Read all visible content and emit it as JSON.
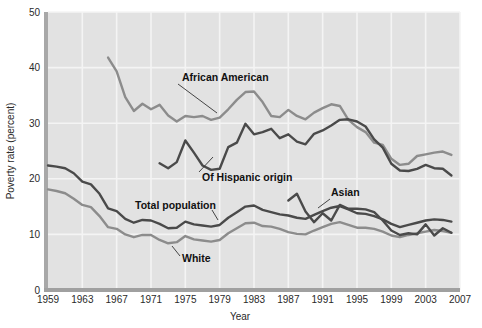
{
  "figure": {
    "background": "#ffffff",
    "plot_background": "#e2e2e2",
    "gridline_color": "#f4f4f4",
    "axis_color": "#9a9a9a"
  },
  "axes": {
    "y_title": "Poverty rate (percent)",
    "x_title": "Year",
    "y_ticks": [
      "0",
      "10",
      "20",
      "30",
      "40",
      "50"
    ],
    "x_ticks": [
      "1959",
      "1963",
      "1967",
      "1971",
      "1975",
      "1979",
      "1983",
      "1987",
      "1991",
      "1995",
      "1999",
      "2003",
      "2007"
    ]
  },
  "labels": {
    "african_american": "African American",
    "hispanic": "Of Hispanic origin",
    "total_population": "Total population",
    "white": "White",
    "asian": "Asian"
  },
  "chart_data": {
    "type": "line",
    "title": "",
    "xlabel": "Year",
    "ylabel": "Poverty rate (percent)",
    "xlim": [
      1959,
      2007
    ],
    "ylim": [
      0,
      50
    ],
    "grid": true,
    "legend": "inline-annotations",
    "x_tick_step": 4,
    "y_tick_step": 10,
    "colors": {
      "african_american": "#8c8c8c",
      "hispanic": "#4a4a4a",
      "total_population": "#4a4a4a",
      "white": "#8c8c8c",
      "asian": "#4a4a4a"
    },
    "series": [
      {
        "name": "African American",
        "color": "#8c8c8c",
        "x": [
          1966,
          1967,
          1968,
          1969,
          1970,
          1971,
          1972,
          1973,
          1974,
          1975,
          1976,
          1977,
          1978,
          1979,
          1980,
          1981,
          1982,
          1983,
          1984,
          1985,
          1986,
          1987,
          1988,
          1989,
          1990,
          1991,
          1992,
          1993,
          1994,
          1995,
          1996,
          1997,
          1998,
          1999,
          2000,
          2001,
          2002,
          2003,
          2004,
          2005,
          2006
        ],
        "values": [
          41.8,
          39.3,
          34.7,
          32.2,
          33.5,
          32.5,
          33.3,
          31.4,
          30.3,
          31.3,
          31.1,
          31.3,
          30.6,
          31.0,
          32.5,
          34.2,
          35.6,
          35.7,
          33.8,
          31.3,
          31.1,
          32.4,
          31.3,
          30.7,
          31.9,
          32.7,
          33.4,
          33.1,
          30.6,
          29.3,
          28.4,
          26.5,
          26.1,
          23.6,
          22.5,
          22.7,
          24.1,
          24.4,
          24.7,
          24.9,
          24.3
        ]
      },
      {
        "name": "Of Hispanic origin",
        "color": "#4a4a4a",
        "x": [
          1972,
          1973,
          1974,
          1975,
          1976,
          1977,
          1978,
          1979,
          1980,
          1981,
          1982,
          1983,
          1984,
          1985,
          1986,
          1987,
          1988,
          1989,
          1990,
          1991,
          1992,
          1993,
          1994,
          1995,
          1996,
          1997,
          1998,
          1999,
          2000,
          2001,
          2002,
          2003,
          2004,
          2005,
          2006
        ],
        "values": [
          22.8,
          21.9,
          23.0,
          26.9,
          24.7,
          22.4,
          21.6,
          21.8,
          25.7,
          26.5,
          29.9,
          28.0,
          28.4,
          29.0,
          27.3,
          28.0,
          26.7,
          26.2,
          28.1,
          28.7,
          29.6,
          30.6,
          30.7,
          30.3,
          29.4,
          27.1,
          25.6,
          22.7,
          21.5,
          21.4,
          21.8,
          22.5,
          21.9,
          21.8,
          20.6
        ]
      },
      {
        "name": "Total population",
        "color": "#4a4a4a",
        "x": [
          1959,
          1960,
          1961,
          1962,
          1963,
          1964,
          1965,
          1966,
          1967,
          1968,
          1969,
          1970,
          1971,
          1972,
          1973,
          1974,
          1975,
          1976,
          1977,
          1978,
          1979,
          1980,
          1981,
          1982,
          1983,
          1984,
          1985,
          1986,
          1987,
          1988,
          1989,
          1990,
          1991,
          1992,
          1993,
          1994,
          1995,
          1996,
          1997,
          1998,
          1999,
          2000,
          2001,
          2002,
          2003,
          2004,
          2005,
          2006
        ],
        "values": [
          22.4,
          22.2,
          21.9,
          21.0,
          19.5,
          19.0,
          17.3,
          14.7,
          14.2,
          12.8,
          12.1,
          12.6,
          12.5,
          11.9,
          11.1,
          11.2,
          12.3,
          11.8,
          11.6,
          11.4,
          11.7,
          13.0,
          14.0,
          15.0,
          15.2,
          14.4,
          14.0,
          13.6,
          13.4,
          13.0,
          12.8,
          13.5,
          14.2,
          14.8,
          15.1,
          14.5,
          13.8,
          13.7,
          13.3,
          12.7,
          11.9,
          11.3,
          11.7,
          12.1,
          12.5,
          12.7,
          12.6,
          12.3
        ]
      },
      {
        "name": "White",
        "color": "#8c8c8c",
        "x": [
          1959,
          1960,
          1961,
          1962,
          1963,
          1964,
          1965,
          1966,
          1967,
          1968,
          1969,
          1970,
          1971,
          1972,
          1973,
          1974,
          1975,
          1976,
          1977,
          1978,
          1979,
          1980,
          1981,
          1982,
          1983,
          1984,
          1985,
          1986,
          1987,
          1988,
          1989,
          1990,
          1991,
          1992,
          1993,
          1994,
          1995,
          1996,
          1997,
          1998,
          1999,
          2000,
          2001,
          2002,
          2003,
          2004,
          2005,
          2006
        ],
        "values": [
          18.1,
          17.8,
          17.4,
          16.4,
          15.3,
          14.9,
          13.3,
          11.3,
          11.0,
          10.0,
          9.5,
          9.9,
          9.9,
          9.0,
          8.4,
          8.6,
          9.7,
          9.1,
          8.9,
          8.7,
          9.0,
          10.2,
          11.1,
          12.0,
          12.1,
          11.5,
          11.4,
          11.0,
          10.4,
          10.1,
          10.0,
          10.7,
          11.3,
          11.9,
          12.2,
          11.7,
          11.2,
          11.2,
          11.0,
          10.5,
          9.8,
          9.5,
          9.9,
          10.2,
          10.5,
          10.8,
          10.6,
          10.3
        ]
      },
      {
        "name": "Asian",
        "color": "#4a4a4a",
        "x": [
          1987,
          1988,
          1989,
          1990,
          1991,
          1992,
          1993,
          1994,
          1995,
          1996,
          1997,
          1998,
          1999,
          2000,
          2001,
          2002,
          2003,
          2004,
          2005,
          2006
        ],
        "values": [
          16.1,
          17.3,
          14.1,
          12.2,
          13.8,
          12.5,
          15.3,
          14.6,
          14.6,
          14.5,
          14.0,
          12.5,
          10.7,
          9.9,
          10.2,
          10.0,
          11.8,
          9.8,
          11.1,
          10.3
        ]
      }
    ]
  }
}
